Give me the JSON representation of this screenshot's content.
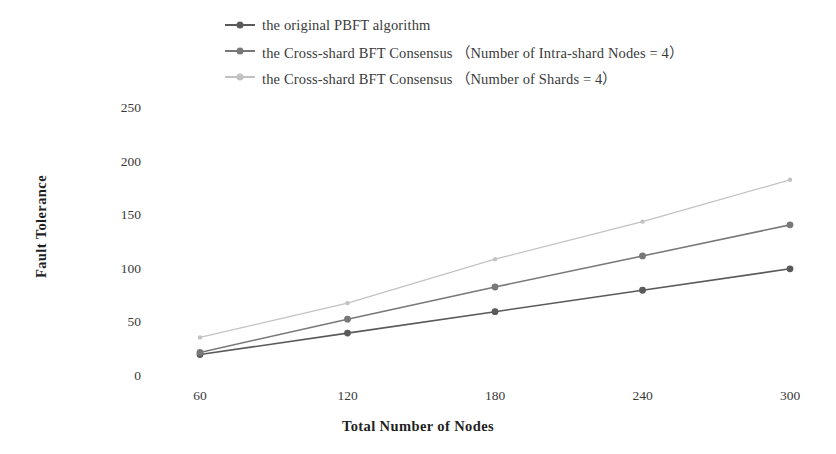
{
  "chart_data": {
    "type": "line",
    "title": "",
    "xlabel": "Total Number of Nodes",
    "ylabel": "Fault  Tolerance",
    "x": [
      60,
      120,
      180,
      240,
      300
    ],
    "xticklabels": [
      "60",
      "120",
      "180",
      "240",
      "300"
    ],
    "yticks": [
      0,
      50,
      100,
      150,
      200,
      250
    ],
    "yticklabels": [
      "0",
      "50",
      "100",
      "150",
      "200",
      "250"
    ],
    "xlim": [
      60,
      300
    ],
    "ylim": [
      0,
      250
    ],
    "grid": false,
    "legend_position": "top-center",
    "series": [
      {
        "name": "the original PBFT algorithm",
        "values": [
          20,
          40,
          60,
          80,
          100
        ],
        "color": "#5a5a5a",
        "marker": "circle"
      },
      {
        "name": "the Cross-shard BFT Consensus （Number of Intra-shard Nodes = 4）",
        "values": [
          22,
          53,
          83,
          112,
          141
        ],
        "color": "#787878",
        "marker": "circle"
      },
      {
        "name": "the Cross-shard BFT Consensus （Number of Shards = 4）",
        "values": [
          36,
          68,
          109,
          144,
          183
        ],
        "color": "#c2c2c2",
        "marker": "circle"
      }
    ]
  },
  "legend": {
    "items": [
      {
        "label": "the original PBFT algorithm",
        "color": "#5a5a5a"
      },
      {
        "label": "the Cross-shard BFT Consensus （Number of Intra-shard Nodes = 4）",
        "color": "#787878"
      },
      {
        "label": "the Cross-shard BFT Consensus （Number of Shards = 4）",
        "color": "#c2c2c2"
      }
    ]
  },
  "axes": {
    "x_title": "Total Number of Nodes",
    "y_title": "Fault  Tolerance"
  }
}
